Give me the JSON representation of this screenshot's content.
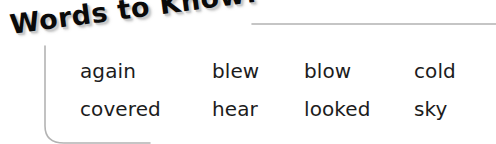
{
  "banner": {
    "title": "Words to Know!"
  },
  "frame": {
    "line_color": "#b3b3b3"
  },
  "word_list": {
    "rows": [
      [
        "again",
        "blew",
        "blow",
        "cold"
      ],
      [
        "covered",
        "hear",
        "looked",
        "sky"
      ]
    ]
  }
}
